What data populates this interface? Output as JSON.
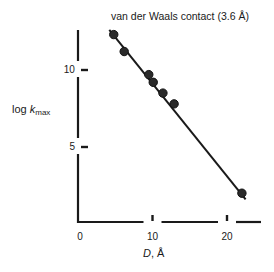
{
  "chart_data": {
    "type": "scatter",
    "title": "van der Waals contact (3.6 Å)",
    "xlabel": "D, Å",
    "xlabel_var": "D",
    "xlabel_unit": ", Å",
    "ylabel": "log k_max",
    "ylabel_var": "k",
    "ylabel_prefix": "log ",
    "ylabel_sub": "max",
    "xlim": [
      0,
      24
    ],
    "ylim": [
      0,
      13
    ],
    "xticks": [
      0,
      10,
      20
    ],
    "yticks": [
      5,
      10
    ],
    "xtick_labels": [
      "0",
      "10",
      "20"
    ],
    "ytick_labels": [
      "5",
      "10"
    ],
    "grid": false,
    "legend": null,
    "series": [
      {
        "name": "data points",
        "x": [
          4.8,
          6.2,
          9.5,
          10.1,
          11.4,
          12.9,
          22.0
        ],
        "y": [
          12.3,
          11.2,
          9.7,
          9.2,
          8.5,
          7.8,
          2.0
        ]
      },
      {
        "name": "fit line",
        "type": "line",
        "x": [
          4.2,
          22.5
        ],
        "y": [
          12.6,
          1.6
        ]
      }
    ],
    "annotations": [
      "van der Waals contact (3.6 Å)"
    ]
  }
}
